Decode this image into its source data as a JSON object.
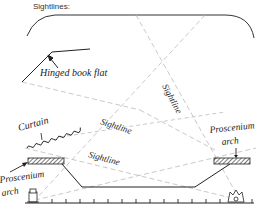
{
  "title": "Sightlines:",
  "labels": {
    "hinged_book_flat": "Hinged book flat",
    "curtain": "Curtain",
    "sightline_1": "Sightline",
    "sightline_2": "Sightline",
    "sightline_3": "Sightline",
    "proscenium_arch_left_1": "Proscenium",
    "proscenium_arch_left_2": "arch",
    "proscenium_arch_right_1": "Proscenium",
    "proscenium_arch_right_2": "arch"
  },
  "colors": {
    "line": "#222222",
    "sightline_dash": "#bbbbbb",
    "background": "#ffffff"
  },
  "audience_row": {
    "seat_ticks": 16
  }
}
